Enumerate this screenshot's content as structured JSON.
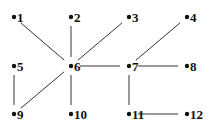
{
  "diagram": {
    "type": "undirected-graph",
    "nodes": [
      {
        "id": "1",
        "label": "1",
        "x": 14,
        "y": 17
      },
      {
        "id": "2",
        "label": "2",
        "x": 71,
        "y": 17
      },
      {
        "id": "3",
        "label": "3",
        "x": 129,
        "y": 17
      },
      {
        "id": "4",
        "label": "4",
        "x": 187,
        "y": 17
      },
      {
        "id": "5",
        "label": "5",
        "x": 14,
        "y": 66
      },
      {
        "id": "6",
        "label": "6",
        "x": 71,
        "y": 66
      },
      {
        "id": "7",
        "label": "7",
        "x": 129,
        "y": 66
      },
      {
        "id": "8",
        "label": "8",
        "x": 187,
        "y": 66
      },
      {
        "id": "9",
        "label": "9",
        "x": 14,
        "y": 114
      },
      {
        "id": "10",
        "label": "10",
        "x": 71,
        "y": 114
      },
      {
        "id": "11",
        "label": "11",
        "x": 129,
        "y": 114
      },
      {
        "id": "12",
        "label": "12",
        "x": 187,
        "y": 114
      }
    ],
    "edges": [
      [
        "1",
        "6"
      ],
      [
        "2",
        "6"
      ],
      [
        "3",
        "6"
      ],
      [
        "6",
        "7"
      ],
      [
        "4",
        "7"
      ],
      [
        "7",
        "8"
      ],
      [
        "5",
        "9"
      ],
      [
        "6",
        "9"
      ],
      [
        "6",
        "10"
      ],
      [
        "7",
        "11"
      ],
      [
        "11",
        "12"
      ]
    ]
  }
}
